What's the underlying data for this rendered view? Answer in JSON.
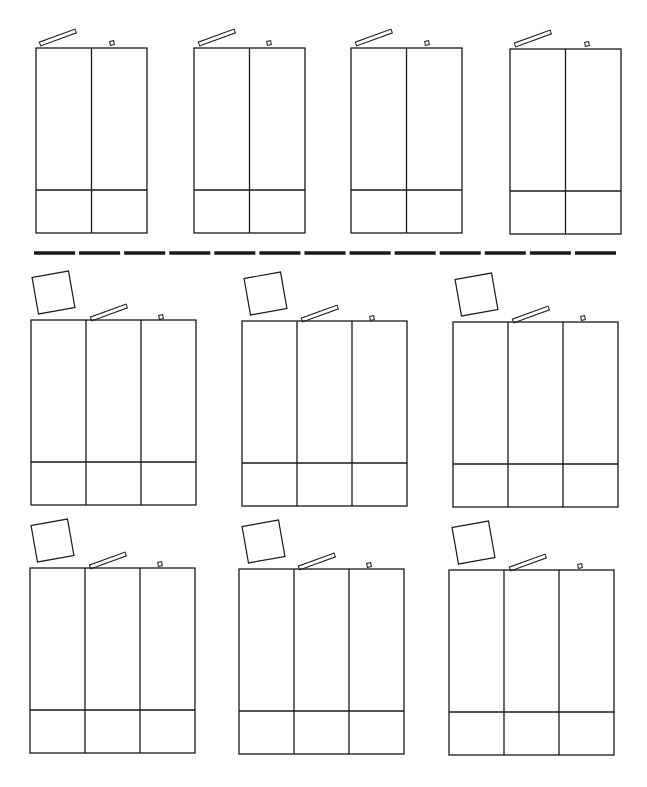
{
  "diagram": {
    "width": 647,
    "height": 787,
    "background": "#ffffff",
    "stroke_color": "#1a1a1a",
    "separator": {
      "y": 253,
      "x_start": 34,
      "x_end": 620,
      "dash_count": 13,
      "thickness": 3.5
    },
    "wardrobes": [
      {
        "id": 1,
        "doors": 2,
        "x": 36,
        "y": 48,
        "w": 111,
        "h": 185,
        "base_y": 190,
        "bar": {
          "x": 40,
          "y": 38,
          "len": 38,
          "angle": -20
        },
        "knob": {
          "x": 110,
          "y": 41
        },
        "box": null
      },
      {
        "id": 2,
        "doors": 2,
        "x": 194,
        "y": 48,
        "w": 111,
        "h": 185,
        "base_y": 190,
        "bar": {
          "x": 199,
          "y": 38,
          "len": 38,
          "angle": -20
        },
        "knob": {
          "x": 267,
          "y": 41
        },
        "box": null
      },
      {
        "id": 3,
        "doors": 2,
        "x": 351,
        "y": 48,
        "w": 111,
        "h": 185,
        "base_y": 190,
        "bar": {
          "x": 356,
          "y": 38,
          "len": 38,
          "angle": -20
        },
        "knob": {
          "x": 425,
          "y": 41
        },
        "box": null
      },
      {
        "id": 4,
        "doors": 2,
        "x": 510,
        "y": 49,
        "w": 111,
        "h": 185,
        "base_y": 191,
        "bar": {
          "x": 515,
          "y": 39,
          "len": 38,
          "angle": -20
        },
        "knob": {
          "x": 585,
          "y": 42
        },
        "box": null
      },
      {
        "id": 5,
        "doors": 3,
        "x": 31,
        "y": 320,
        "w": 165,
        "h": 185,
        "base_y": 462,
        "bar": {
          "x": 91,
          "y": 313,
          "len": 38,
          "angle": -20
        },
        "knob": {
          "x": 159,
          "y": 315
        },
        "box": {
          "x": 35,
          "y": 274,
          "size": 37,
          "angle": -10
        }
      },
      {
        "id": 6,
        "doors": 3,
        "x": 242,
        "y": 321,
        "w": 165,
        "h": 185,
        "base_y": 463,
        "bar": {
          "x": 302,
          "y": 314,
          "len": 38,
          "angle": -20
        },
        "knob": {
          "x": 370,
          "y": 316
        },
        "box": {
          "x": 247,
          "y": 275,
          "size": 37,
          "angle": -10
        }
      },
      {
        "id": 7,
        "doors": 3,
        "x": 453,
        "y": 322,
        "w": 165,
        "h": 185,
        "base_y": 464,
        "bar": {
          "x": 513,
          "y": 315,
          "len": 38,
          "angle": -20
        },
        "knob": {
          "x": 581,
          "y": 316
        },
        "box": {
          "x": 458,
          "y": 276,
          "size": 37,
          "angle": -10
        }
      },
      {
        "id": 8,
        "doors": 3,
        "x": 30,
        "y": 568,
        "w": 165,
        "h": 185,
        "base_y": 710,
        "bar": {
          "x": 90,
          "y": 561,
          "len": 38,
          "angle": -20
        },
        "knob": {
          "x": 158,
          "y": 562
        },
        "box": {
          "x": 34,
          "y": 522,
          "size": 37,
          "angle": -10
        }
      },
      {
        "id": 9,
        "doors": 3,
        "x": 239,
        "y": 569,
        "w": 165,
        "h": 185,
        "base_y": 711,
        "bar": {
          "x": 299,
          "y": 562,
          "len": 38,
          "angle": -20
        },
        "knob": {
          "x": 367,
          "y": 563
        },
        "box": {
          "x": 245,
          "y": 523,
          "size": 37,
          "angle": -10
        }
      },
      {
        "id": 10,
        "doors": 3,
        "x": 449,
        "y": 570,
        "w": 165,
        "h": 185,
        "base_y": 712,
        "bar": {
          "x": 510,
          "y": 563,
          "len": 38,
          "angle": -20
        },
        "knob": {
          "x": 578,
          "y": 564
        },
        "box": {
          "x": 455,
          "y": 524,
          "size": 37,
          "angle": -10
        }
      }
    ]
  }
}
